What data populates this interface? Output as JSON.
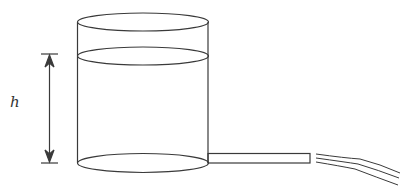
{
  "diagram": {
    "type": "physics-figure",
    "labels": {
      "height": "h"
    },
    "colors": {
      "stroke": "#3a3a3a",
      "background": "#ffffff"
    },
    "components": [
      {
        "name": "cylinder-tank",
        "label": ""
      },
      {
        "name": "water-surface",
        "label": ""
      },
      {
        "name": "height-dimension-arrow",
        "label": "h"
      },
      {
        "name": "outlet-pipe",
        "label": ""
      },
      {
        "name": "water-jet",
        "label": ""
      }
    ]
  }
}
